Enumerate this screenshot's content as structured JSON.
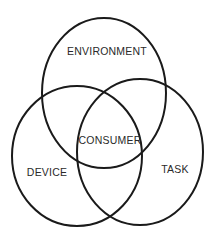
{
  "diagram": {
    "type": "venn",
    "sets": [
      {
        "id": "environment",
        "label": "ENVIRONMENT",
        "cx": 104,
        "cy": 93,
        "rx": 62,
        "ry": 75,
        "label_x": 107,
        "label_y": 52
      },
      {
        "id": "device",
        "label": "DEVICE",
        "cx": 77,
        "cy": 156,
        "rx": 65,
        "ry": 70,
        "label_x": 47,
        "label_y": 173
      },
      {
        "id": "task",
        "label": "TASK",
        "cx": 140,
        "cy": 152,
        "rx": 63,
        "ry": 73,
        "label_x": 175,
        "label_y": 170
      }
    ],
    "intersection": {
      "label": "CONSUMER",
      "label_x": 110,
      "label_y": 141
    },
    "stroke_color": "#1a1a1a",
    "background": "#ffffff"
  }
}
